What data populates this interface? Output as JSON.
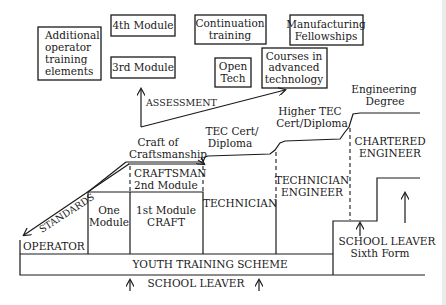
{
  "diagram": {
    "title": "",
    "top_boxes": {
      "additional_operator": [
        "Additional",
        "operator",
        "training",
        "elements"
      ],
      "fourth_module": "4th Module",
      "third_module": "3rd Module",
      "continuation": [
        "Continuation",
        "training"
      ],
      "manufacturing": [
        "Manufacturing",
        "Fellowships"
      ],
      "open_tech": [
        "Open",
        "Tech"
      ],
      "advanced_courses": [
        "Courses in",
        "advanced",
        "technology"
      ]
    },
    "arrows": {
      "assessment": "ASSESSMENT",
      "standards": "STANDARDS"
    },
    "stage_labels": {
      "craft_of_craftsmanship": [
        "Craft of",
        "Craftsmanship"
      ],
      "tec_cert": [
        "TEC Cert/",
        "Diploma"
      ],
      "higher_tec": [
        "Higher TEC",
        "Cert/Diploma"
      ],
      "engineering_degree": [
        "Engineering",
        "Degree"
      ]
    },
    "cells": {
      "craftsman": [
        "CRAFTSMAN",
        "2nd Module"
      ],
      "one_module": [
        "One",
        "Module"
      ],
      "first_module": [
        "1st Module",
        "CRAFT"
      ],
      "technician": "TECHNICIAN",
      "technician_engineer": [
        "TECHNICIAN",
        "ENGINEER"
      ],
      "chartered_engineer": [
        "CHARTERED",
        "ENGINEER"
      ],
      "operator": "OPERATOR"
    },
    "bottom": {
      "youth_training": "YOUTH TRAINING SCHEME",
      "school_leaver": "SCHOOL LEAVER",
      "school_leaver_sixth": [
        "SCHOOL LEAVER",
        "Sixth Form"
      ]
    }
  }
}
